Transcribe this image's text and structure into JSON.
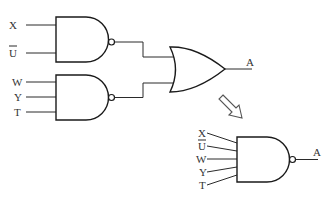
{
  "diagram": {
    "circuit_left": {
      "gate1": {
        "type": "NAND",
        "inputs": [
          "X",
          "Ū"
        ]
      },
      "gate2": {
        "type": "NAND",
        "inputs": [
          "W",
          "Y",
          "T"
        ]
      },
      "gate3": {
        "type": "OR",
        "inputs": [
          "gate1",
          "gate2"
        ],
        "output": "A"
      }
    },
    "transform_arrow": "hollow-arrow-down-right",
    "circuit_right": {
      "gate": {
        "type": "NAND",
        "inputs": [
          "X",
          "Ū",
          "W",
          "Y",
          "T"
        ],
        "output": "A"
      }
    },
    "labels": {
      "g1_in1": "X",
      "g1_in2": "U",
      "g2_in1": "W",
      "g2_in2": "Y",
      "g2_in3": "T",
      "or_out": "A",
      "r_in1": "X",
      "r_in2": "U",
      "r_in3": "W",
      "r_in4": "Y",
      "r_in5": "T",
      "r_out": "A"
    }
  }
}
